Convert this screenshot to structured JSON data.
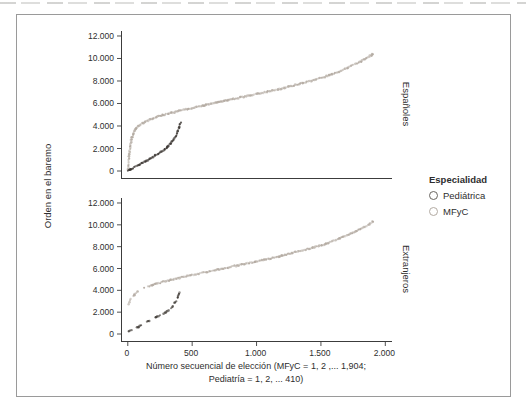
{
  "figure": {
    "ylabel": "Orden en el baremo",
    "xlabel_line1": "Número secuencial de elección (MFyC = 1, 2 ,... 1,904;",
    "xlabel_line2": "Pediatría = 1, 2, ... 410)",
    "legend": {
      "title": "Especialidad",
      "items": [
        {
          "label": "Pediátrica",
          "color": "#6a6661"
        },
        {
          "label": "MFyC",
          "color": "#b2aaa2"
        }
      ]
    },
    "colors": {
      "axis": "#3c3c3c",
      "text": "#2e2e2e",
      "frame_border": "#9a9a9a",
      "mfyc_curve": "#b2a9a0",
      "pediatrica_curve": "#38332f"
    }
  },
  "chart_data": [
    {
      "type": "scatter",
      "panel_label": "Españoles",
      "xlim": [
        -45,
        2052
      ],
      "ylim": [
        -622,
        12444
      ],
      "grid": false,
      "yticks": [
        {
          "v": 0,
          "label": "0"
        },
        {
          "v": 2000,
          "label": "2.000"
        },
        {
          "v": 4000,
          "label": "4.000"
        },
        {
          "v": 6000,
          "label": "6.000"
        },
        {
          "v": 8000,
          "label": "8.000"
        },
        {
          "v": 10000,
          "label": "10.000"
        },
        {
          "v": 12000,
          "label": "12.000"
        }
      ],
      "xticks": [],
      "series": [
        {
          "name": "MFyC",
          "color": "#b2a9a0",
          "style": "dense",
          "points": [
            [
              2,
              60
            ],
            [
              6,
              700
            ],
            [
              10,
              1300
            ],
            [
              16,
              1900
            ],
            [
              24,
              2500
            ],
            [
              35,
              3050
            ],
            [
              50,
              3500
            ],
            [
              70,
              3850
            ],
            [
              95,
              4100
            ],
            [
              130,
              4350
            ],
            [
              180,
              4600
            ],
            [
              250,
              4900
            ],
            [
              330,
              5150
            ],
            [
              420,
              5400
            ],
            [
              520,
              5650
            ],
            [
              620,
              5900
            ],
            [
              720,
              6150
            ],
            [
              820,
              6400
            ],
            [
              920,
              6650
            ],
            [
              1020,
              6900
            ],
            [
              1120,
              7150
            ],
            [
              1220,
              7400
            ],
            [
              1320,
              7700
            ],
            [
              1420,
              8000
            ],
            [
              1520,
              8350
            ],
            [
              1620,
              8750
            ],
            [
              1720,
              9250
            ],
            [
              1820,
              9800
            ],
            [
              1904,
              10400
            ]
          ]
        },
        {
          "name": "Pediátrica",
          "color": "#38332f",
          "style": "dense",
          "points": [
            [
              2,
              40
            ],
            [
              60,
              380
            ],
            [
              120,
              760
            ],
            [
              180,
              1150
            ],
            [
              240,
              1560
            ],
            [
              290,
              1980
            ],
            [
              330,
              2400
            ],
            [
              360,
              2850
            ],
            [
              380,
              3300
            ],
            [
              393,
              3700
            ],
            [
              403,
              4000
            ],
            [
              410,
              4300
            ]
          ]
        }
      ]
    },
    {
      "type": "scatter",
      "panel_label": "Extranjeros",
      "xlim": [
        -45,
        2052
      ],
      "ylim": [
        -641,
        12458
      ],
      "grid": false,
      "yticks": [
        {
          "v": 0,
          "label": "0"
        },
        {
          "v": 2000,
          "label": "2.000"
        },
        {
          "v": 4000,
          "label": "4.000"
        },
        {
          "v": 6000,
          "label": "6.000"
        },
        {
          "v": 8000,
          "label": "8.000"
        },
        {
          "v": 10000,
          "label": "10.000"
        },
        {
          "v": 12000,
          "label": "12.000"
        }
      ],
      "xticks": [
        {
          "v": 0,
          "label": "0"
        },
        {
          "v": 500,
          "label": "500"
        },
        {
          "v": 1000,
          "label": "1.000"
        },
        {
          "v": 1500,
          "label": "1.500"
        },
        {
          "v": 2000,
          "label": "2.000"
        }
      ],
      "series": [
        {
          "name": "MFyC",
          "color": "#b2a9a0",
          "style": "sparse-start",
          "sparse_until": 160,
          "points": [
            [
              5,
              2650
            ],
            [
              15,
              3050
            ],
            [
              30,
              3350
            ],
            [
              55,
              3650
            ],
            [
              85,
              3950
            ],
            [
              125,
              4200
            ],
            [
              180,
              4450
            ],
            [
              250,
              4700
            ],
            [
              330,
              4950
            ],
            [
              420,
              5200
            ],
            [
              520,
              5450
            ],
            [
              620,
              5700
            ],
            [
              720,
              5950
            ],
            [
              820,
              6200
            ],
            [
              920,
              6450
            ],
            [
              1020,
              6700
            ],
            [
              1120,
              6950
            ],
            [
              1220,
              7250
            ],
            [
              1320,
              7550
            ],
            [
              1420,
              7850
            ],
            [
              1520,
              8200
            ],
            [
              1620,
              8650
            ],
            [
              1720,
              9150
            ],
            [
              1820,
              9700
            ],
            [
              1904,
              10300
            ]
          ]
        },
        {
          "name": "Pediátrica",
          "color": "#403b36",
          "style": "dashed",
          "points": [
            [
              8,
              250
            ],
            [
              60,
              550
            ],
            [
              110,
              850
            ],
            [
              160,
              1150
            ],
            [
              210,
              1450
            ],
            [
              260,
              1750
            ],
            [
              300,
              2050
            ],
            [
              335,
              2400
            ],
            [
              360,
              2750
            ],
            [
              378,
              3100
            ],
            [
              392,
              3500
            ],
            [
              403,
              3800
            ],
            [
              410,
              3950
            ]
          ]
        }
      ]
    }
  ]
}
